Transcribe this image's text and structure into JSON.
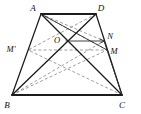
{
  "figure": {
    "type": "geometry-diagram",
    "canvas": {
      "width": 141,
      "height": 114
    },
    "colors": {
      "solid_stroke": "#1c1c1c",
      "dashed_stroke": "#8c8c8c",
      "background": "#ffffff",
      "label": "#111111"
    },
    "points": [
      {
        "id": "A",
        "label": "A",
        "x": 41,
        "y": 14,
        "label_x": 33,
        "label_y": 9
      },
      {
        "id": "D",
        "label": "D",
        "x": 96,
        "y": 14,
        "label_x": 99,
        "label_y": 9
      },
      {
        "id": "B",
        "label": "B",
        "x": 12,
        "y": 95,
        "label_x": 5,
        "label_y": 107
      },
      {
        "id": "C",
        "label": "C",
        "x": 122,
        "y": 95,
        "label_x": 119,
        "label_y": 107
      },
      {
        "id": "O",
        "label": "O",
        "x": 66,
        "y": 41,
        "label_x": 54,
        "label_y": 42
      },
      {
        "id": "N",
        "label": "N",
        "x": 104,
        "y": 41,
        "label_x": 107,
        "label_y": 39
      },
      {
        "id": "M",
        "label": "M",
        "x": 107,
        "y": 50,
        "label_x": 111,
        "label_y": 52
      },
      {
        "id": "Mp",
        "label": "M'",
        "x": 28,
        "y": 50,
        "label_x": 5,
        "label_y": 51
      }
    ],
    "solid_edges": [
      {
        "name": "edge-AD",
        "from": "A",
        "to": "D"
      },
      {
        "name": "edge-AB",
        "from": "A",
        "to": "B"
      },
      {
        "name": "edge-DC",
        "from": "D",
        "to": "C"
      },
      {
        "name": "edge-BC",
        "from": "B",
        "to": "C"
      },
      {
        "name": "diagonal-AC",
        "from": "A",
        "to": "C"
      },
      {
        "name": "diagonal-DB",
        "from": "D",
        "to": "B"
      },
      {
        "name": "segment-ON",
        "from": "O",
        "to": "N"
      },
      {
        "name": "segment-AM",
        "from": "A",
        "to": "M"
      },
      {
        "name": "segment-NC",
        "from": "N",
        "to": "C"
      }
    ],
    "dashed_edges": [
      {
        "name": "dashed-midline-MpM",
        "from": "Mp",
        "to": "M"
      },
      {
        "name": "dashed-A-to-M",
        "from": "A",
        "to": "M"
      },
      {
        "name": "dashed-A-to-N",
        "from": "A",
        "to": "N"
      },
      {
        "name": "dashed-B-to-M",
        "from": "B",
        "to": "M"
      },
      {
        "name": "dashed-B-to-N",
        "from": "B",
        "to": "N"
      },
      {
        "name": "dashed-B-to-D",
        "from": "B",
        "to": "D"
      },
      {
        "name": "dashed-C-to-Mp",
        "from": "C",
        "to": "Mp"
      },
      {
        "name": "dashed-C-to-A",
        "from": "C",
        "to": "A"
      },
      {
        "name": "dashed-D-to-Mp",
        "from": "D",
        "to": "Mp"
      }
    ],
    "arrow_marks": [
      {
        "name": "arrow-on",
        "at": "N",
        "direction": "right"
      }
    ]
  }
}
